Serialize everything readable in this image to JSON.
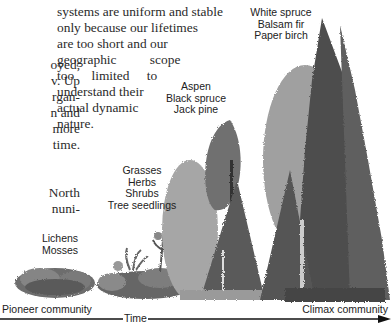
{
  "body_text": {
    "left_column": [
      "oyed,",
      "v. Up",
      "rgan-",
      "n and",
      "more",
      "time."
    ],
    "left_column_2": [
      "North",
      "nuni-"
    ],
    "middle_column": [
      "systems are uniform and stable",
      "only because our lifetimes",
      "are too short and our",
      "geographic scope",
      "too limited to",
      "understand their",
      "actual dynamic",
      "nature."
    ]
  },
  "stages": [
    {
      "id": "pioneer",
      "species": [
        "Lichens",
        "Mosses"
      ]
    },
    {
      "id": "early",
      "species": [
        "Grasses",
        "Herbs",
        "Shrubs",
        "Tree seedlings"
      ]
    },
    {
      "id": "mid",
      "species": [
        "Aspen",
        "Black spruce",
        "Jack pine"
      ]
    },
    {
      "id": "climax",
      "species": [
        "White spruce",
        "Balsam fir",
        "Paper birch"
      ]
    }
  ],
  "timeline": {
    "start_label": "Pioneer community",
    "end_label": "Climax community",
    "axis_label": "Time"
  },
  "colors": {
    "text": "#2a2a2a",
    "dark_foliage": "#4a4a4a",
    "light_foliage": "#9a9a9a",
    "rock": "#6a6a6a",
    "axis": "#111111"
  }
}
